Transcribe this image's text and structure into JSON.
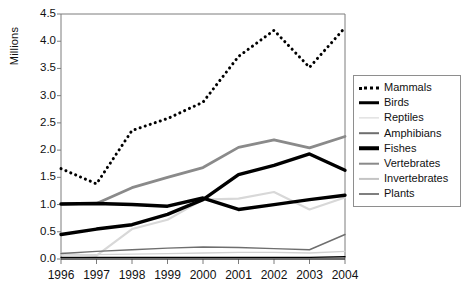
{
  "chart_data": {
    "type": "line",
    "title": "",
    "xlabel": "",
    "ylabel": "Millions",
    "categories": [
      "1996",
      "1997",
      "1998",
      "1999",
      "2000",
      "2001",
      "2002",
      "2003",
      "2004"
    ],
    "x": [
      1996,
      1997,
      1998,
      1999,
      2000,
      2001,
      2002,
      2003,
      2004
    ],
    "ylim": [
      0.0,
      4.5
    ],
    "yticks": [
      "0.0",
      "0.5",
      "1.0",
      "1.5",
      "2.0",
      "2.5",
      "3.0",
      "3.5",
      "4.0",
      "4.5"
    ],
    "ytick_values": [
      0.0,
      0.5,
      1.0,
      1.5,
      2.0,
      2.5,
      3.0,
      3.5,
      4.0,
      4.5
    ],
    "grid": false,
    "legend_position": "right",
    "series": [
      {
        "name": "Mammals",
        "values": [
          1.66,
          1.38,
          2.36,
          2.58,
          2.88,
          3.72,
          4.2,
          3.52,
          4.25
        ],
        "color": "#000000",
        "style": "dotted",
        "width": 3.0
      },
      {
        "name": "Birds",
        "values": [
          1.01,
          1.02,
          1.0,
          0.97,
          1.12,
          0.91,
          1.0,
          1.09,
          1.17
        ],
        "color": "#000000",
        "style": "solid",
        "width": 3.4
      },
      {
        "name": "Reptiles",
        "values": [
          0.07,
          0.08,
          0.09,
          0.1,
          0.11,
          0.12,
          0.12,
          0.11,
          0.14
        ],
        "color": "#d2d2d2",
        "style": "solid",
        "width": 1.3
      },
      {
        "name": "Amphibians",
        "values": [
          0.1,
          0.14,
          0.17,
          0.2,
          0.22,
          0.21,
          0.19,
          0.17,
          0.45
        ],
        "color": "#6e6e6e",
        "style": "solid",
        "width": 1.4
      },
      {
        "name": "Fishes",
        "values": [
          0.45,
          0.55,
          0.63,
          0.82,
          1.09,
          1.55,
          1.72,
          1.93,
          1.63
        ],
        "color": "#000000",
        "style": "solid",
        "width": 3.4
      },
      {
        "name": "Vertebrates",
        "values": [
          1.01,
          1.02,
          1.31,
          1.5,
          1.68,
          2.05,
          2.19,
          2.04,
          2.25
        ],
        "color": "#8a8a8a",
        "style": "solid",
        "width": 2.8
      },
      {
        "name": "Invertebrates",
        "values": [
          0.1,
          0.06,
          0.55,
          0.72,
          1.09,
          1.11,
          1.23,
          0.91,
          1.13
        ],
        "color": "#d8d8d8",
        "style": "solid",
        "width": 2.2
      },
      {
        "name": "Plants",
        "values": [
          0.03,
          0.03,
          0.03,
          0.03,
          0.03,
          0.03,
          0.03,
          0.03,
          0.04
        ],
        "color": "#000000",
        "style": "solid",
        "width": 1.4
      }
    ]
  },
  "legend": {
    "items": [
      {
        "label": "Mammals",
        "swatch": "sw-dotted"
      },
      {
        "label": "Birds",
        "swatch": "sw-thick"
      },
      {
        "label": "Reptiles",
        "swatch": "sw-reptiles"
      },
      {
        "label": "Amphibians",
        "swatch": "sw-amphibians"
      },
      {
        "label": "Fishes",
        "swatch": "sw-thick"
      },
      {
        "label": "Vertebrates",
        "swatch": "sw-vertebrates"
      },
      {
        "label": "Invertebrates",
        "swatch": "sw-invertebrates"
      },
      {
        "label": "Plants",
        "swatch": "sw-thin"
      }
    ]
  },
  "axes": {
    "frame_color": "#7d7d7d",
    "tick_color": "#7d7d7d",
    "baseline_color": "#3a3a3a"
  }
}
